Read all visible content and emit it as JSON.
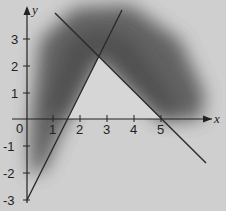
{
  "figure": {
    "type": "linear-inequalities-graph",
    "background_color": "#cfcfcf",
    "shade_color": "#5a5a5a",
    "line_color": "#2a2a2a",
    "axes": {
      "x_label": "x",
      "y_label": "y",
      "x_ticks": [
        "1",
        "2",
        "3",
        "4",
        "5"
      ],
      "y_ticks": [
        "3",
        "2",
        "1",
        "-1",
        "-2",
        "-3"
      ],
      "origin_label": "0",
      "x_range": [
        -1,
        7.3
      ],
      "y_range": [
        -3.4,
        4.4
      ]
    },
    "lines": [
      {
        "name": "rising-line",
        "equation": "y = 2x - 3",
        "from": [
          0,
          -3
        ],
        "to": [
          3.52,
          4.04
        ]
      },
      {
        "name": "falling-line",
        "equation": "y = -x + 5",
        "from": [
          1.1,
          3.9
        ],
        "to": [
          6.63,
          -1.63
        ]
      }
    ],
    "unshaded_region": {
      "description": "triangle bounded by the two lines and the x-axis",
      "vertices": [
        [
          1.5,
          0
        ],
        [
          2.67,
          2.33
        ],
        [
          5,
          0
        ]
      ]
    },
    "intersection_point": [
      2.67,
      2.33
    ]
  }
}
